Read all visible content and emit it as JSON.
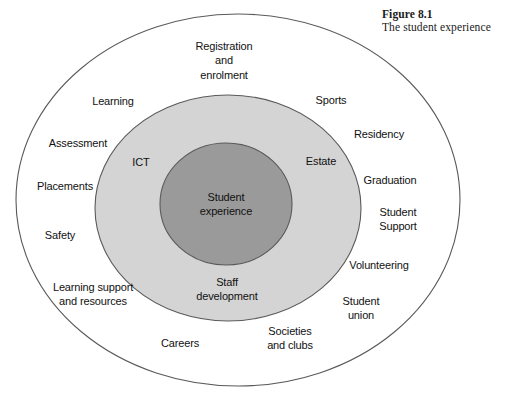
{
  "caption": {
    "figure_number": "Figure 8.1",
    "figure_title": "The student experience"
  },
  "diagram": {
    "type": "concentric-ellipse-venn",
    "rings": [
      {
        "name": "outer-ring",
        "fill": "#ffffff",
        "stroke": "#5a5a5a"
      },
      {
        "name": "middle-ring",
        "fill": "#d4d4d4",
        "stroke": "#5a5a5a"
      },
      {
        "name": "inner-ring",
        "fill": "#9a9a9a",
        "stroke": "#5a5a5a"
      }
    ],
    "center_label": "Student\nexperience",
    "middle_labels": [
      {
        "id": "ict",
        "text": "ICT"
      },
      {
        "id": "estate",
        "text": "Estate"
      },
      {
        "id": "staff-development",
        "text": "Staff\ndevelopment"
      }
    ],
    "outer_labels": [
      {
        "id": "registration-and-enrolment",
        "text": "Registration\nand\nenrolment"
      },
      {
        "id": "learning",
        "text": "Learning"
      },
      {
        "id": "sports",
        "text": "Sports"
      },
      {
        "id": "assessment",
        "text": "Assessment"
      },
      {
        "id": "residency",
        "text": "Residency"
      },
      {
        "id": "placements",
        "text": "Placements"
      },
      {
        "id": "graduation",
        "text": "Graduation"
      },
      {
        "id": "safety",
        "text": "Safety"
      },
      {
        "id": "student-support",
        "text": "Student\nSupport"
      },
      {
        "id": "volunteering",
        "text": "Volunteering"
      },
      {
        "id": "learning-support-and-resources",
        "text": "Learning support\nand resources"
      },
      {
        "id": "student-union",
        "text": "Student\nunion"
      },
      {
        "id": "careers",
        "text": "Careers"
      },
      {
        "id": "societies-and-clubs",
        "text": "Societies\nand clubs"
      }
    ]
  }
}
